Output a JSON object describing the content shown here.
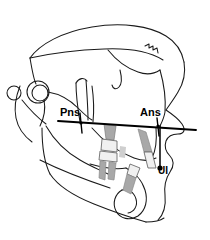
{
  "figure": {
    "type": "cephalometric-tracing",
    "width": 210,
    "height": 240,
    "background_color": "#ffffff",
    "line_color": "#1a1a1a",
    "tooth_shade_color": "#9e9e9e",
    "tooth_crown_color": "#f2f2f2"
  },
  "labels": {
    "pns": "Pns",
    "ans": "Ans",
    "ui": "UI"
  },
  "landmarks": [
    {
      "name": "pns",
      "label": "Pns",
      "x": 80,
      "y": 124
    },
    {
      "name": "ans",
      "label": "Ans",
      "x": 158,
      "y": 126
    },
    {
      "name": "ui",
      "label": "UI",
      "x": 160,
      "y": 168
    }
  ],
  "measurement_lines": [
    {
      "name": "palatal-plane",
      "from": "Pns",
      "to": "Ans",
      "x1": 58,
      "y1": 121,
      "x2": 196,
      "y2": 130
    },
    {
      "name": "ans-ui-vertical",
      "from": "Ans",
      "to": "UI",
      "x1": 160,
      "y1": 126,
      "x2": 160,
      "y2": 168
    }
  ]
}
